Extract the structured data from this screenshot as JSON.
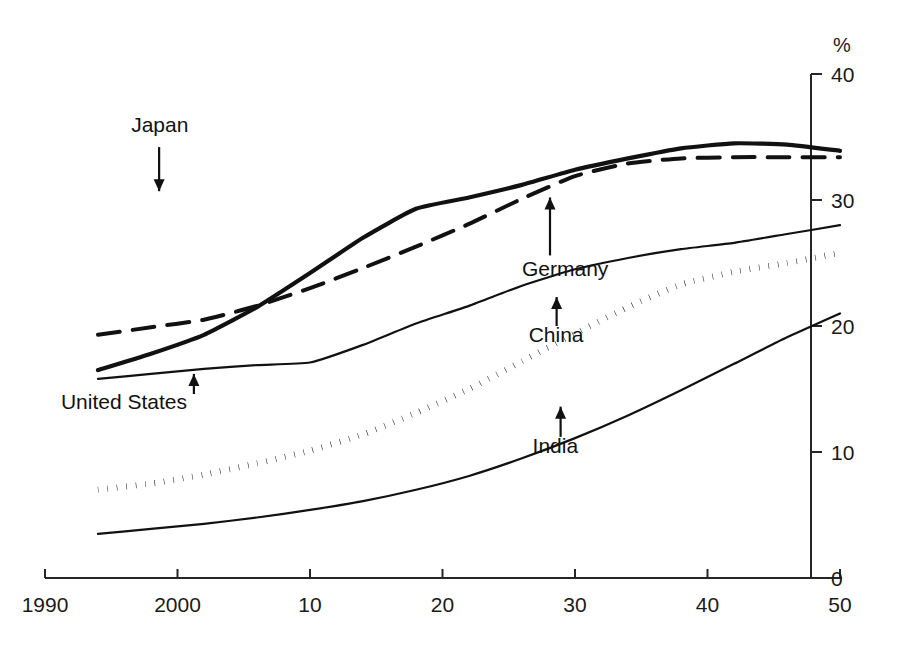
{
  "chart_data": {
    "type": "line",
    "title": "",
    "subtitle": "",
    "xlabel": "",
    "ylabel": "",
    "unit_label": "%",
    "xlim": [
      1990,
      2050
    ],
    "ylim": [
      0,
      40
    ],
    "grid": false,
    "legend_position": "inline-annotations",
    "x_ticks": [
      {
        "value": 1990,
        "label": "1990"
      },
      {
        "value": 2000,
        "label": "2000"
      },
      {
        "value": 2010,
        "label": "10"
      },
      {
        "value": 2020,
        "label": "20"
      },
      {
        "value": 2030,
        "label": "30"
      },
      {
        "value": 2040,
        "label": "40"
      },
      {
        "value": 2050,
        "label": "50"
      }
    ],
    "y_ticks": [
      {
        "value": 0,
        "label": "0"
      },
      {
        "value": 10,
        "label": "10"
      },
      {
        "value": 20,
        "label": "20"
      },
      {
        "value": 30,
        "label": "30"
      },
      {
        "value": 40,
        "label": "40"
      }
    ],
    "y_axis_side": "right",
    "x": [
      1994,
      1998,
      2002,
      2006,
      2010,
      2014,
      2018,
      2022,
      2026,
      2030,
      2034,
      2038,
      2042,
      2046,
      2050
    ],
    "series": [
      {
        "name": "Japan",
        "style": "thick-solid",
        "values": [
          16.5,
          17.8,
          19.3,
          21.5,
          24.2,
          27.0,
          29.3,
          30.2,
          31.2,
          32.4,
          33.3,
          34.1,
          34.5,
          34.4,
          33.9
        ]
      },
      {
        "name": "Germany",
        "style": "dashed",
        "values": [
          19.3,
          19.9,
          20.5,
          21.6,
          23.0,
          24.6,
          26.3,
          28.1,
          30.1,
          31.9,
          32.9,
          33.3,
          33.4,
          33.4,
          33.4
        ]
      },
      {
        "name": "United States",
        "style": "thin-solid",
        "values": [
          15.8,
          16.2,
          16.6,
          16.9,
          17.1,
          18.5,
          20.2,
          21.6,
          23.2,
          24.5,
          25.4,
          26.1,
          26.6,
          27.3,
          28.0
        ]
      },
      {
        "name": "China",
        "style": "dotted",
        "values": [
          7.0,
          7.5,
          8.2,
          9.1,
          10.1,
          11.4,
          13.1,
          15.0,
          17.2,
          19.4,
          21.5,
          23.3,
          24.3,
          25.0,
          25.8
        ]
      },
      {
        "name": "India",
        "style": "thin-solid",
        "values": [
          3.5,
          3.9,
          4.3,
          4.8,
          5.4,
          6.1,
          7.0,
          8.1,
          9.5,
          11.1,
          12.9,
          14.9,
          17.0,
          19.1,
          21.0
        ]
      }
    ],
    "annotations": [
      {
        "label": "Japan",
        "series": "Japan",
        "text_x": 1996.5,
        "text_y": 35.4,
        "arrow": "down",
        "arrow_from_y": 34.2,
        "arrow_to_y": 30.7
      },
      {
        "label": "Germany",
        "series": "Germany",
        "text_x": 2026.0,
        "text_y": 24.0,
        "arrow": "up",
        "arrow_from_y": 25.6,
        "arrow_to_y": 30.2
      },
      {
        "label": "United States",
        "series": "United States",
        "text_x": 1991.2,
        "text_y": 13.4,
        "arrow": "up",
        "arrow_from_y": 14.6,
        "arrow_to_y": 16.2
      },
      {
        "label": "China",
        "series": "China",
        "text_x": 2026.5,
        "text_y": 18.7,
        "arrow": "up",
        "arrow_from_y": 20.0,
        "arrow_to_y": 22.3
      },
      {
        "label": "India",
        "series": "India",
        "text_x": 2026.8,
        "text_y": 9.9,
        "arrow": "up",
        "arrow_from_y": 11.2,
        "arrow_to_y": 13.6
      }
    ]
  }
}
